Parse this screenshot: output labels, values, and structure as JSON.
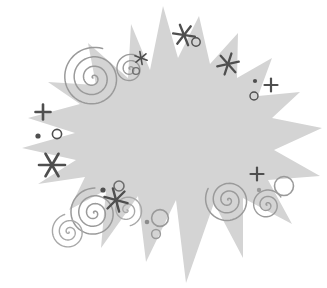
{
  "document": {
    "title": "Starburst Clipart Illustration",
    "width": 327,
    "height": 288,
    "background_color": "#ffffff",
    "description": "Light gray jagged starburst / explosion burst shape decorated with dark gray sparkle stars, plus marks, dots, ring outlines and gray spiral swirls"
  },
  "palette": {
    "burst_fill": "#d4d4d4",
    "burst_fill_alt": "#d0d0d0",
    "sparkle_dark": "#4f4f4f",
    "sparkle_mid": "#5a5a5a",
    "ring_stroke": "#4f4f4f",
    "swirl_stroke": "#9a9a9a",
    "swirl_stroke_light": "#a8a8a8",
    "page_background": "#ffffff"
  },
  "artwork": {
    "burst": {
      "name": "starburst-shape",
      "fill": "#d4d4d4",
      "point_count": 18,
      "center": [
        163,
        146
      ],
      "points": [
        [
          163,
          6
        ],
        [
          178,
          58
        ],
        [
          199,
          16
        ],
        [
          210,
          64
        ],
        [
          238,
          33
        ],
        [
          237,
          78
        ],
        [
          272,
          58
        ],
        [
          258,
          96
        ],
        [
          300,
          92
        ],
        [
          272,
          118
        ],
        [
          322,
          128
        ],
        [
          274,
          150
        ],
        [
          320,
          176
        ],
        [
          268,
          180
        ],
        [
          292,
          224
        ],
        [
          243,
          198
        ],
        [
          243,
          258
        ],
        [
          214,
          203
        ],
        [
          186,
          283
        ],
        [
          176,
          200
        ],
        [
          146,
          262
        ],
        [
          138,
          196
        ],
        [
          101,
          248
        ],
        [
          106,
          190
        ],
        [
          69,
          210
        ],
        [
          85,
          177
        ],
        [
          38,
          184
        ],
        [
          76,
          160
        ],
        [
          22,
          148
        ],
        [
          75,
          133
        ],
        [
          28,
          118
        ],
        [
          80,
          104
        ],
        [
          48,
          82
        ],
        [
          96,
          85
        ],
        [
          88,
          43
        ],
        [
          128,
          78
        ],
        [
          131,
          24
        ],
        [
          150,
          70
        ]
      ]
    },
    "stars": [
      {
        "name": "star-top-center",
        "cx": 184,
        "cy": 35,
        "r": 11,
        "points": 6,
        "color": "#4f4f4f",
        "weight": 2.3,
        "rotation": 8
      },
      {
        "name": "star-top-right",
        "cx": 228,
        "cy": 64,
        "r": 11,
        "points": 6,
        "color": "#4f4f4f",
        "weight": 2.3,
        "rotation": -12
      },
      {
        "name": "star-upper-left-small",
        "cx": 141,
        "cy": 58,
        "r": 6.5,
        "points": 6,
        "color": "#4f4f4f",
        "weight": 1.6,
        "rotation": 20
      },
      {
        "name": "star-left-large",
        "cx": 52,
        "cy": 165,
        "r": 13,
        "points": 6,
        "color": "#4f4f4f",
        "weight": 2.6,
        "rotation": 0
      },
      {
        "name": "star-bottom-center",
        "cx": 116,
        "cy": 200,
        "r": 12,
        "points": 6,
        "color": "#4f4f4f",
        "weight": 2.4,
        "rotation": 15
      }
    ],
    "plus_marks": [
      {
        "name": "plus-left",
        "cx": 43,
        "cy": 112,
        "r": 7.5,
        "color": "#4f4f4f",
        "weight": 2.6
      },
      {
        "name": "plus-right",
        "cx": 271,
        "cy": 85,
        "r": 6.5,
        "color": "#4f4f4f",
        "weight": 2.2
      },
      {
        "name": "plus-bottom-right",
        "cx": 257,
        "cy": 174,
        "r": 6.5,
        "color": "#4f4f4f",
        "weight": 2.2
      }
    ],
    "dots": [
      {
        "name": "dot-left",
        "cx": 38,
        "cy": 136,
        "r": 2.6,
        "color": "#4f4f4f"
      },
      {
        "name": "dot-right",
        "cx": 255,
        "cy": 81,
        "r": 2.1,
        "color": "#4f4f4f"
      },
      {
        "name": "dot-bottom-left",
        "cx": 103,
        "cy": 190,
        "r": 2.6,
        "color": "#4f4f4f"
      },
      {
        "name": "dot-bottom-center",
        "cx": 147,
        "cy": 222,
        "r": 2.3,
        "color": "#8c8c8c"
      },
      {
        "name": "dot-bottom-right",
        "cx": 259,
        "cy": 190,
        "r": 2.2,
        "color": "#9a9a9a"
      }
    ],
    "rings": [
      {
        "name": "ring-top-center",
        "cx": 196,
        "cy": 42,
        "r": 4.2,
        "stroke": "#4f4f4f",
        "weight": 1.4
      },
      {
        "name": "ring-right",
        "cx": 254,
        "cy": 96,
        "r": 4.0,
        "stroke": "#4f4f4f",
        "weight": 1.4
      },
      {
        "name": "ring-left",
        "cx": 57,
        "cy": 134,
        "r": 4.6,
        "stroke": "#4f4f4f",
        "weight": 1.6
      },
      {
        "name": "ring-bottom-left",
        "cx": 119,
        "cy": 186,
        "r": 5.0,
        "stroke": "#6e6e6e",
        "weight": 1.6
      },
      {
        "name": "ring-spiral-small",
        "cx": 136,
        "cy": 71,
        "r": 3.4,
        "stroke": "#6e6e6e",
        "weight": 1.3
      },
      {
        "name": "ring-bottom-center-large",
        "cx": 160,
        "cy": 218,
        "r": 8.4,
        "stroke": "#9a9a9a",
        "weight": 1.6
      },
      {
        "name": "ring-bottom-center-small",
        "cx": 156,
        "cy": 234,
        "r": 4.4,
        "stroke": "#9a9a9a",
        "weight": 1.5
      },
      {
        "name": "ring-bottom-right-large",
        "cx": 284,
        "cy": 186,
        "r": 9.5,
        "stroke": "#9a9a9a",
        "weight": 1.6
      }
    ],
    "swirls": [
      {
        "name": "swirl-upper-left-large",
        "cx": 93,
        "cy": 78,
        "turns": 3.3,
        "r_max": 31,
        "stroke": "#9a9a9a",
        "weight": 1.5,
        "start_angle": 180
      },
      {
        "name": "swirl-upper-left-small",
        "cx": 130,
        "cy": 69,
        "turns": 2.4,
        "r_max": 15,
        "stroke": "#9a9a9a",
        "weight": 1.4,
        "start_angle": 150
      },
      {
        "name": "swirl-bottom-left-large",
        "cx": 94,
        "cy": 213,
        "turns": 3.2,
        "r_max": 25,
        "stroke": "#9a9a9a",
        "weight": 1.5,
        "start_angle": 200
      },
      {
        "name": "swirl-bottom-left-outer",
        "cx": 69,
        "cy": 232,
        "turns": 2.6,
        "r_max": 18,
        "stroke": "#a8a8a8",
        "weight": 1.4,
        "start_angle": 40
      },
      {
        "name": "swirl-bottom-left-right",
        "cx": 127,
        "cy": 210,
        "turns": 2.3,
        "r_max": 16,
        "stroke": "#a8a8a8",
        "weight": 1.4,
        "start_angle": 330
      },
      {
        "name": "swirl-bottom-right-large",
        "cx": 228,
        "cy": 200,
        "turns": 3.0,
        "r_max": 23,
        "stroke": "#9a9a9a",
        "weight": 1.5,
        "start_angle": 210
      },
      {
        "name": "swirl-bottom-right-small",
        "cx": 267,
        "cy": 205,
        "turns": 2.5,
        "r_max": 16,
        "stroke": "#9a9a9a",
        "weight": 1.4,
        "start_angle": 150
      }
    ]
  }
}
